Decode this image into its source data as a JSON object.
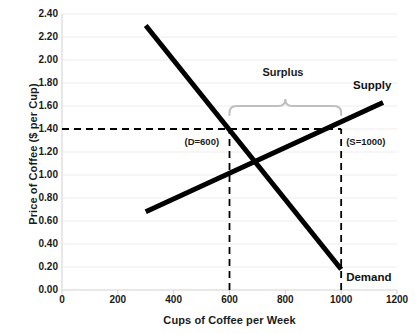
{
  "chart_data": {
    "type": "line",
    "title": "",
    "xlabel": "Cups of Coffee per Week",
    "ylabel": "Price of Coffee ($ per Cup)",
    "xlim": [
      0,
      1200
    ],
    "ylim": [
      0.0,
      2.4
    ],
    "grid": true,
    "legend_position": "inline-end-of-line",
    "x_ticks": [
      "0",
      "200",
      "400",
      "600",
      "800",
      "1000",
      "1200"
    ],
    "x_tick_values": [
      0,
      200,
      400,
      600,
      800,
      1000,
      1200
    ],
    "y_ticks": [
      "0.00",
      "0.20",
      "0.40",
      "0.60",
      "0.80",
      "1.00",
      "1.20",
      "1.40",
      "1.60",
      "1.80",
      "2.00",
      "2.20",
      "2.40"
    ],
    "y_tick_values": [
      0.0,
      0.2,
      0.4,
      0.6,
      0.8,
      1.0,
      1.2,
      1.4,
      1.6,
      1.8,
      2.0,
      2.2,
      2.4
    ],
    "series": [
      {
        "name": "Demand",
        "label": "Demand",
        "color": "#000000",
        "points": [
          [
            300,
            2.3
          ],
          [
            1000,
            0.18
          ]
        ]
      },
      {
        "name": "Supply",
        "label": "Supply",
        "color": "#000000",
        "points": [
          [
            300,
            0.68
          ],
          [
            1150,
            1.63
          ]
        ]
      }
    ],
    "reference_lines": [
      {
        "name": "price-floor",
        "orientation": "horizontal",
        "value": 1.4,
        "x_from": 0,
        "x_to": 1000,
        "style": "dashed",
        "color": "#000000"
      },
      {
        "name": "quantity-demanded",
        "orientation": "vertical",
        "value": 600,
        "y_from": 0.0,
        "y_to": 1.4,
        "style": "dashed",
        "color": "#000000"
      },
      {
        "name": "quantity-supplied",
        "orientation": "vertical",
        "value": 1000,
        "y_from": 0.0,
        "y_to": 1.4,
        "style": "dashed",
        "color": "#000000"
      }
    ],
    "annotations": [
      {
        "name": "demand-quantity-annotation",
        "text": "(D=600)",
        "x": 600,
        "y": 1.3
      },
      {
        "name": "supply-quantity-annotation",
        "text": "(S=1000)",
        "x": 1000,
        "y": 1.3
      },
      {
        "name": "surplus-annotation",
        "text": "Surplus",
        "x": 800,
        "y": 1.9
      }
    ],
    "brace": {
      "name": "surplus-brace",
      "label": "Surplus",
      "from_x": 600,
      "to_x": 1000,
      "at_y": 1.4,
      "color": "#bfbfbf"
    },
    "equilibrium": {
      "x": 715,
      "y": 1.08
    }
  },
  "style": {
    "background": "#ffffff",
    "gridline_color": "#ededed",
    "axis_color": "#d9d9d9",
    "text_color": "#1a1a1a",
    "series_color": "#000000",
    "brace_color": "#bfbfbf"
  }
}
